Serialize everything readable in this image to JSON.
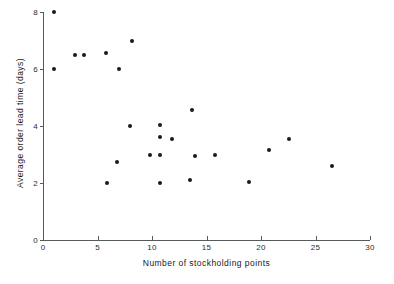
{
  "chart_data": {
    "type": "scatter",
    "title": "",
    "xlabel": "Number of stockholding points",
    "ylabel": "Average order lead time (days)",
    "xlim": [
      0,
      30
    ],
    "ylim": [
      0,
      8
    ],
    "xticks": [
      0,
      5,
      10,
      15,
      20,
      25,
      30
    ],
    "xtick_labels": [
      "0",
      "5",
      "10",
      "15",
      "20",
      "25",
      "30"
    ],
    "yticks": [
      0,
      2,
      4,
      6,
      8
    ],
    "ytick_labels": [
      "0",
      "2",
      "4",
      "6",
      "8"
    ],
    "grid": false,
    "legend": null,
    "marker": "filled-circle",
    "marker_color": "#1b1b1b",
    "axis_color": "#555a5a",
    "points": [
      {
        "x": 1.0,
        "y": 8.0
      },
      {
        "x": 1.0,
        "y": 6.0
      },
      {
        "x": 2.9,
        "y": 6.5
      },
      {
        "x": 3.8,
        "y": 6.5
      },
      {
        "x": 5.8,
        "y": 6.55
      },
      {
        "x": 7.0,
        "y": 6.0
      },
      {
        "x": 8.2,
        "y": 7.0
      },
      {
        "x": 5.9,
        "y": 2.0
      },
      {
        "x": 6.8,
        "y": 2.75
      },
      {
        "x": 8.0,
        "y": 4.0
      },
      {
        "x": 9.8,
        "y": 3.0
      },
      {
        "x": 10.7,
        "y": 4.05
      },
      {
        "x": 10.7,
        "y": 3.6
      },
      {
        "x": 10.7,
        "y": 3.0
      },
      {
        "x": 10.7,
        "y": 2.0
      },
      {
        "x": 11.8,
        "y": 3.55
      },
      {
        "x": 13.7,
        "y": 4.55
      },
      {
        "x": 13.5,
        "y": 2.1
      },
      {
        "x": 13.9,
        "y": 2.95
      },
      {
        "x": 15.8,
        "y": 3.0
      },
      {
        "x": 18.9,
        "y": 2.05
      },
      {
        "x": 20.7,
        "y": 3.15
      },
      {
        "x": 22.6,
        "y": 3.55
      },
      {
        "x": 26.5,
        "y": 2.6
      }
    ]
  }
}
